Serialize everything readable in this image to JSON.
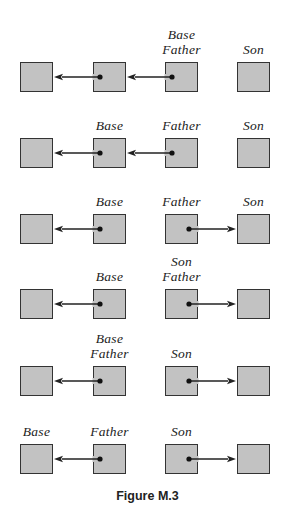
{
  "figure": {
    "caption": "Figure M.3",
    "colors": {
      "box_fill": "#c2c2c2",
      "box_border": "#333333",
      "arrow": "#222222",
      "label": "#222222"
    },
    "columns_x": [
      20,
      93,
      165,
      237
    ],
    "rows": [
      {
        "box_top": 62,
        "labels": [
          {
            "col": 2,
            "lines": [
              "Base",
              "Father"
            ]
          },
          {
            "col": 3,
            "lines": [
              "Son"
            ]
          }
        ],
        "arrows": [
          {
            "from": 2,
            "to": 1,
            "direction": "left"
          },
          {
            "from": 1,
            "to": 0,
            "direction": "left"
          }
        ]
      },
      {
        "box_top": 138,
        "labels": [
          {
            "col": 1,
            "lines": [
              "Base"
            ]
          },
          {
            "col": 2,
            "lines": [
              "Father"
            ]
          },
          {
            "col": 3,
            "lines": [
              "Son"
            ]
          }
        ],
        "arrows": [
          {
            "from": 2,
            "to": 1,
            "direction": "left"
          },
          {
            "from": 1,
            "to": 0,
            "direction": "left"
          }
        ]
      },
      {
        "box_top": 214,
        "labels": [
          {
            "col": 1,
            "lines": [
              "Base"
            ]
          },
          {
            "col": 2,
            "lines": [
              "Father"
            ]
          },
          {
            "col": 3,
            "lines": [
              "Son"
            ]
          }
        ],
        "arrows": [
          {
            "from": 1,
            "to": 0,
            "direction": "left"
          },
          {
            "from": 2,
            "to": 3,
            "direction": "right"
          }
        ]
      },
      {
        "box_top": 289,
        "labels": [
          {
            "col": 1,
            "lines": [
              "Base"
            ]
          },
          {
            "col": 2,
            "lines": [
              "Son",
              "Father"
            ]
          }
        ],
        "arrows": [
          {
            "from": 1,
            "to": 0,
            "direction": "left"
          },
          {
            "from": 2,
            "to": 3,
            "direction": "right"
          }
        ]
      },
      {
        "box_top": 366,
        "labels": [
          {
            "col": 1,
            "lines": [
              "Base",
              "Father"
            ]
          },
          {
            "col": 2,
            "lines": [
              "Son"
            ]
          }
        ],
        "arrows": [
          {
            "from": 1,
            "to": 0,
            "direction": "left"
          },
          {
            "from": 2,
            "to": 3,
            "direction": "right"
          }
        ]
      },
      {
        "box_top": 444,
        "labels": [
          {
            "col": 0,
            "lines": [
              "Base"
            ]
          },
          {
            "col": 1,
            "lines": [
              "Father"
            ]
          },
          {
            "col": 2,
            "lines": [
              "Son"
            ]
          }
        ],
        "arrows": [
          {
            "from": 1,
            "to": 0,
            "direction": "left"
          },
          {
            "from": 2,
            "to": 3,
            "direction": "right"
          }
        ]
      }
    ]
  }
}
